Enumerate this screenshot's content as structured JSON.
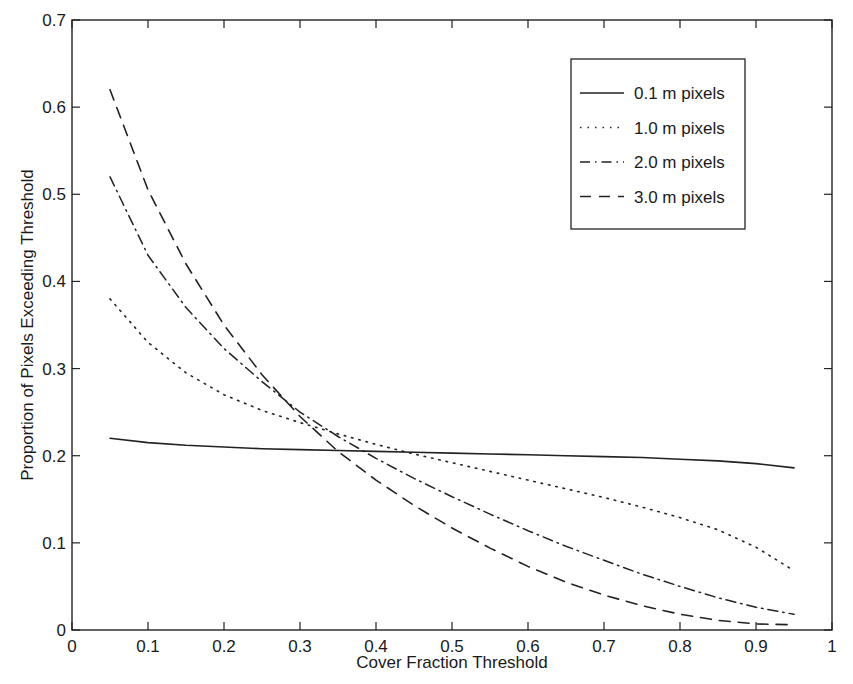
{
  "chart_data": {
    "type": "line",
    "title": "",
    "xlabel": "Cover Fraction Threshold",
    "ylabel": "Proportion of Pixels Exceeding Threshold",
    "xlim": [
      0,
      1
    ],
    "ylim": [
      0,
      0.7
    ],
    "xticks": [
      "0",
      "0.1",
      "0.2",
      "0.3",
      "0.4",
      "0.5",
      "0.6",
      "0.7",
      "0.8",
      "0.9",
      "1"
    ],
    "yticks": [
      "0",
      "0.1",
      "0.2",
      "0.3",
      "0.4",
      "0.5",
      "0.6",
      "0.7"
    ],
    "grid": false,
    "legend_position": "upper right",
    "x": [
      0.05,
      0.1,
      0.15,
      0.2,
      0.25,
      0.3,
      0.35,
      0.4,
      0.45,
      0.5,
      0.55,
      0.6,
      0.65,
      0.7,
      0.75,
      0.8,
      0.85,
      0.9,
      0.95
    ],
    "series": [
      {
        "name": "0.1 m pixels",
        "style": "solid",
        "values": [
          0.22,
          0.215,
          0.212,
          0.21,
          0.208,
          0.207,
          0.206,
          0.205,
          0.204,
          0.203,
          0.202,
          0.201,
          0.2,
          0.199,
          0.198,
          0.196,
          0.194,
          0.191,
          0.186
        ]
      },
      {
        "name": "1.0 m pixels",
        "style": "dotted",
        "values": [
          0.38,
          0.33,
          0.295,
          0.27,
          0.252,
          0.238,
          0.225,
          0.213,
          0.202,
          0.192,
          0.182,
          0.172,
          0.162,
          0.152,
          0.141,
          0.129,
          0.115,
          0.095,
          0.068
        ]
      },
      {
        "name": "2.0 m pixels",
        "style": "dash-dot",
        "values": [
          0.52,
          0.43,
          0.37,
          0.323,
          0.285,
          0.25,
          0.222,
          0.197,
          0.174,
          0.153,
          0.133,
          0.114,
          0.096,
          0.08,
          0.064,
          0.05,
          0.037,
          0.026,
          0.018
        ]
      },
      {
        "name": "3.0 m pixels",
        "style": "dashed",
        "values": [
          0.62,
          0.505,
          0.42,
          0.35,
          0.293,
          0.245,
          0.205,
          0.172,
          0.143,
          0.117,
          0.094,
          0.073,
          0.055,
          0.04,
          0.028,
          0.018,
          0.011,
          0.007,
          0.006
        ]
      }
    ]
  }
}
